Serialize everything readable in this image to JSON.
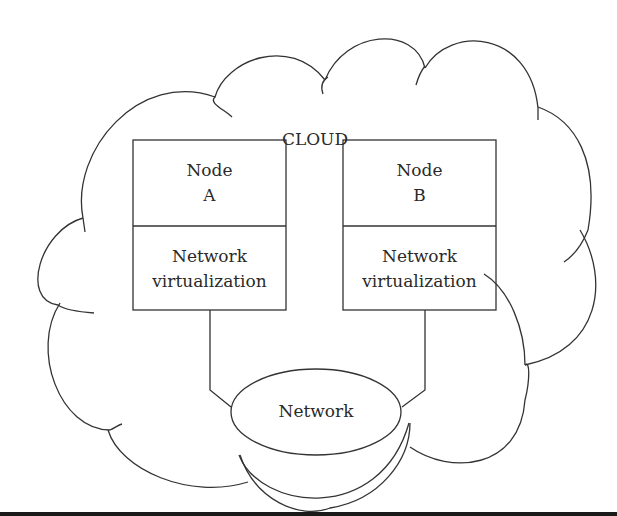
{
  "diagram": {
    "cloud_label": "CLOUD",
    "nodes": [
      {
        "title_line1": "Node",
        "title_line2": "A",
        "layer_line1": "Network",
        "layer_line2": "virtualization"
      },
      {
        "title_line1": "Node",
        "title_line2": "B",
        "layer_line1": "Network",
        "layer_line2": "virtualization"
      }
    ],
    "network_label": "Network",
    "colors": {
      "line": "#333333",
      "text": "#2a2a2a",
      "background": "#ffffff",
      "bottom_bar": "#1a1a1a"
    }
  }
}
